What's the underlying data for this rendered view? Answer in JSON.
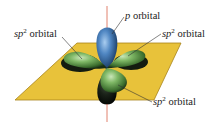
{
  "figure": {
    "colors": {
      "plane": "#e8c23a",
      "plane_edge": "#b8921a",
      "p_orbital": "#3f78b8",
      "sp2_orbital": "#6fa858",
      "axis": "#d9624a",
      "leader": "#333333"
    },
    "labels": [
      {
        "id": "p",
        "italic": "p",
        "sup": "",
        "text": " orbital"
      },
      {
        "id": "sp2_left",
        "italic": "sp",
        "sup": "2",
        "text": " orbital"
      },
      {
        "id": "sp2_right",
        "italic": "sp",
        "sup": "2",
        "text": " orbital"
      },
      {
        "id": "sp2_bottom",
        "italic": "sp",
        "sup": "2",
        "text": " orbital"
      }
    ]
  }
}
